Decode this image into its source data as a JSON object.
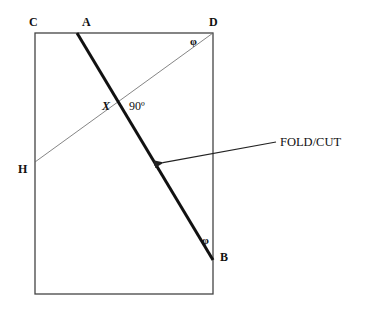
{
  "diagram": {
    "points": {
      "C": "C",
      "A": "A",
      "D": "D",
      "H": "H",
      "X": "X",
      "B": "B"
    },
    "angle_right": "90º",
    "angle_phi_top": "φ",
    "angle_phi_bottom": "φ",
    "callout": "FOLD/CUT",
    "colors": {
      "stroke": "#222222",
      "thin_stroke": "#555555",
      "background": "#ffffff"
    },
    "geometry": {
      "rectangle": {
        "left": 35,
        "top": 33,
        "right": 213,
        "bottom": 294
      },
      "fold_line": {
        "from": "A",
        "to": "B",
        "A": [
          77,
          33
        ],
        "B": [
          213,
          260
        ]
      },
      "diagonal": {
        "from": "D",
        "to": "H",
        "D": [
          213,
          33
        ],
        "H": [
          35,
          162
        ]
      },
      "intersection_X": [
        120,
        106
      ],
      "arrow": {
        "from": [
          276,
          142
        ],
        "to": [
          161,
          163
        ]
      }
    }
  }
}
